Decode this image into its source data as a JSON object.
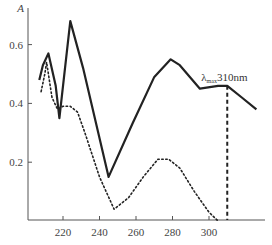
{
  "chart_data": {
    "type": "line",
    "title": "",
    "xlabel": "",
    "ylabel": "A",
    "xlim": [
      202,
      328
    ],
    "ylim": [
      0,
      0.75
    ],
    "grid": false,
    "x_ticks": [
      220,
      240,
      260,
      280,
      300
    ],
    "y_ticks": [
      0.2,
      0.4,
      0.6
    ],
    "x_tick_labels": [
      "220",
      "240",
      "260",
      "280",
      "300"
    ],
    "y_tick_labels": [
      "0.2",
      "0.4",
      "0.6"
    ],
    "series": [
      {
        "name": "solid",
        "style": "solid",
        "x": [
          207,
          209,
          212,
          216,
          218,
          224,
          231,
          245,
          258,
          270,
          279,
          284,
          295,
          305,
          310,
          318,
          326
        ],
        "y": [
          0.48,
          0.53,
          0.57,
          0.46,
          0.35,
          0.68,
          0.52,
          0.15,
          0.33,
          0.49,
          0.55,
          0.53,
          0.45,
          0.46,
          0.46,
          0.42,
          0.38
        ]
      },
      {
        "name": "dotted",
        "style": "dotted",
        "x": [
          208,
          210,
          211,
          214,
          217,
          220,
          224,
          228,
          232,
          240,
          248,
          256,
          264,
          272,
          278,
          284,
          292,
          300,
          305
        ],
        "y": [
          0.44,
          0.5,
          0.54,
          0.42,
          0.38,
          0.39,
          0.39,
          0.37,
          0.3,
          0.15,
          0.04,
          0.08,
          0.15,
          0.21,
          0.21,
          0.18,
          0.1,
          0.03,
          0.0
        ]
      }
    ],
    "annotations": [
      {
        "text_prefix": "λ",
        "subscript": "max",
        "text": "310nm",
        "x": 310,
        "y": 0.46,
        "vline_style": "dashed"
      }
    ]
  },
  "labels": {
    "y_axis": "A",
    "lambda": "λ",
    "lambda_sub": "max",
    "lambda_value": "310nm"
  }
}
